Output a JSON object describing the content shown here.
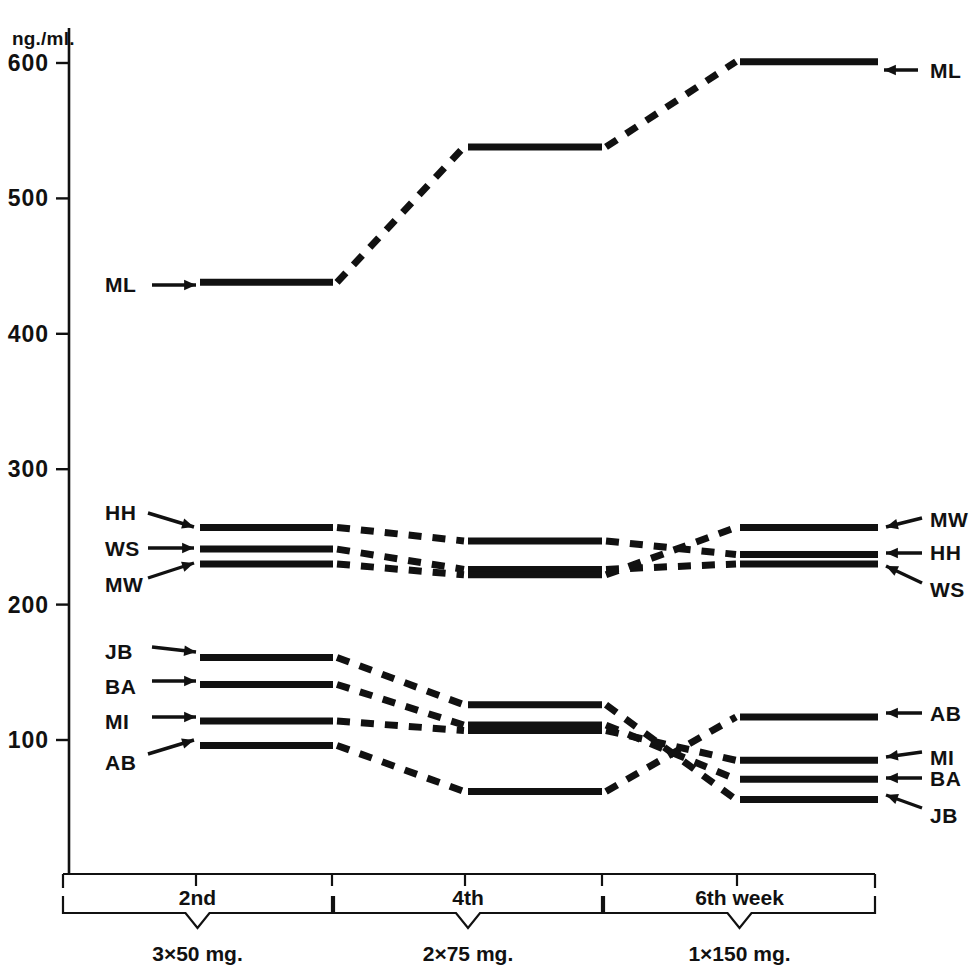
{
  "chart_data": {
    "type": "line",
    "title": "",
    "ylabel": "ng./ml.",
    "xlabel": "",
    "ylim": [
      0,
      640
    ],
    "yticks": [
      100,
      200,
      300,
      400,
      500,
      600
    ],
    "ytick_labels": [
      "100",
      "200",
      "300",
      "400",
      "500",
      "600"
    ],
    "grid": false,
    "legend": "inline-arrows-left-and-right",
    "x_categories": [
      "2nd",
      "4th",
      "6th week"
    ],
    "x_period_labels": [
      "2nd",
      "4th",
      "6th week"
    ],
    "x_dose_labels": [
      "3×50 mg.",
      "2×75 mg.",
      "1×150 mg."
    ],
    "note": "Each subject is a step-plot: a flat plateau measured in each dosing period, joined by dashed transition segments.",
    "series": [
      {
        "name": "ML",
        "left_label": "ML",
        "right_label": "ML",
        "values": [
          438,
          538,
          601
        ]
      },
      {
        "name": "HH",
        "left_label": "HH",
        "right_label": "HH",
        "values": [
          257,
          247,
          237
        ]
      },
      {
        "name": "WS",
        "left_label": "WS",
        "right_label": "WS",
        "values": [
          241,
          226,
          230
        ]
      },
      {
        "name": "MW",
        "left_label": "MW",
        "right_label": "MW",
        "values": [
          230,
          222,
          257
        ]
      },
      {
        "name": "JB",
        "left_label": "JB",
        "right_label": "JB",
        "values": [
          161,
          126,
          56
        ]
      },
      {
        "name": "BA",
        "left_label": "BA",
        "right_label": "BA",
        "values": [
          141,
          111,
          71
        ]
      },
      {
        "name": "MI",
        "left_label": "MI",
        "right_label": "MI",
        "values": [
          114,
          107,
          85
        ]
      },
      {
        "name": "AB",
        "left_label": "AB",
        "right_label": "AB",
        "values": [
          96,
          62,
          117
        ]
      }
    ],
    "left_arrow_labels": [
      "ML",
      "HH",
      "WS",
      "MW",
      "JB",
      "BA",
      "MI",
      "AB"
    ],
    "right_arrow_labels": [
      "ML",
      "MW",
      "HH",
      "WS",
      "AB",
      "MI",
      "BA",
      "JB"
    ]
  }
}
